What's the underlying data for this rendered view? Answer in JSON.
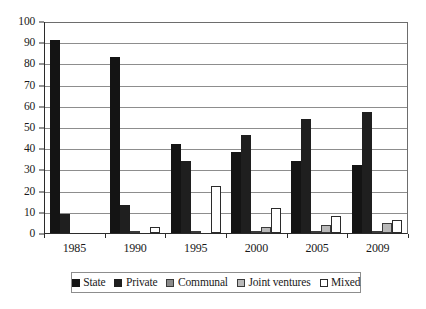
{
  "chart_data": {
    "type": "bar",
    "title": "",
    "subtitle": "",
    "xlabel": "",
    "ylabel": "",
    "ylim": [
      0,
      100
    ],
    "yticks": [
      0,
      10,
      20,
      30,
      40,
      50,
      60,
      70,
      80,
      90,
      100
    ],
    "grid": true,
    "legend_position": "bottom",
    "categories": [
      "1985",
      "1990",
      "1995",
      "2000",
      "2005",
      "2009"
    ],
    "series": [
      {
        "name": "State",
        "color": "#141414",
        "values": [
          91,
          83,
          42,
          38,
          34,
          32
        ]
      },
      {
        "name": "Private",
        "color": "#1f1f1f",
        "values": [
          9,
          13,
          34,
          46,
          54,
          57
        ]
      },
      {
        "name": "Communal",
        "color": "#8a8a8a",
        "values": [
          0,
          1,
          0.5,
          0.5,
          0.5,
          0.3
        ]
      },
      {
        "name": "Joint ventures",
        "color": "#b9b9b9",
        "values": [
          0,
          0,
          0,
          3,
          4,
          4.5
        ]
      },
      {
        "name": "Mixed",
        "color": "#ffffff",
        "values": [
          0,
          3,
          22,
          12,
          8,
          6
        ]
      }
    ]
  },
  "legend": {
    "items": [
      {
        "label": "State"
      },
      {
        "label": "Private"
      },
      {
        "label": "Communal"
      },
      {
        "label": "Joint ventures"
      },
      {
        "label": "Mixed"
      }
    ]
  }
}
